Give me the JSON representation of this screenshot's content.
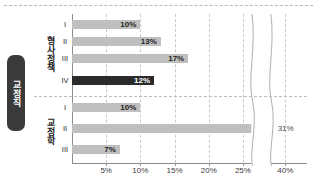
{
  "chart_data": {
    "type": "bar",
    "orientation": "horizontal",
    "title": "",
    "xlabel": "",
    "ylabel": "",
    "outer_category": "교정직",
    "groups": [
      {
        "name": "형사정책",
        "categories": [
          "I",
          "II",
          "III",
          "IV"
        ],
        "values": [
          10,
          13,
          17,
          12
        ],
        "labels": [
          "10%",
          "13%",
          "17%",
          "12%"
        ],
        "highlight_index": 3
      },
      {
        "name": "교정학",
        "categories": [
          "I",
          "II",
          "III"
        ],
        "values": [
          10,
          31,
          7
        ],
        "labels": [
          "10%",
          "31%",
          "7%"
        ],
        "highlight_index": -1
      }
    ],
    "xticks": [
      5,
      10,
      15,
      20,
      25,
      40
    ],
    "xticklabels": [
      "5%",
      "10%",
      "15%",
      "20%",
      "25%",
      "40%"
    ],
    "xlim": [
      0,
      42
    ],
    "axis_break": {
      "from": 26,
      "to": 38,
      "style": "wavy"
    },
    "grid": true,
    "legend": "none",
    "colors": {
      "bar": "#bfbfbf",
      "bar_highlight": "#2b2b2b",
      "badge": "#3a3a3a",
      "axis": "#8c8c8c",
      "grid": "#c9c9c9",
      "text": "#1f1f1f"
    }
  }
}
